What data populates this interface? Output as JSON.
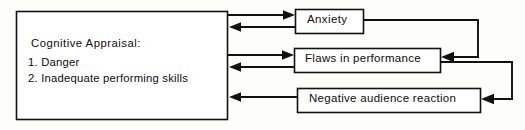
{
  "diagram": {
    "type": "flowchart-feedback-loop",
    "background_color": "#fdfdfb",
    "line_color": "#111111",
    "box_fill": "#ffffff",
    "nodes": [
      {
        "id": "cognitive-appraisal",
        "title": "Cognitive  Appraisal:",
        "items": [
          "1. Danger",
          "2. Inadequate performing skills"
        ]
      },
      {
        "id": "anxiety",
        "label": "Anxiety"
      },
      {
        "id": "flaws-in-performance",
        "label": "Flaws in performance"
      },
      {
        "id": "negative-audience-reaction",
        "label": "Negative audience reaction"
      }
    ],
    "edges": [
      {
        "from": "cognitive-appraisal",
        "to": "anxiety",
        "direction": "right"
      },
      {
        "from": "anxiety",
        "to": "cognitive-appraisal",
        "direction": "left"
      },
      {
        "from": "cognitive-appraisal",
        "to": "flaws-in-performance",
        "direction": "right"
      },
      {
        "from": "flaws-in-performance",
        "to": "cognitive-appraisal",
        "direction": "left"
      },
      {
        "from": "negative-audience-reaction",
        "to": "cognitive-appraisal",
        "direction": "left"
      },
      {
        "from": "anxiety",
        "to": "flaws-in-performance",
        "direction": "loop-right-down-left"
      },
      {
        "from": "flaws-in-performance",
        "to": "negative-audience-reaction",
        "direction": "loop-right-down-left"
      }
    ]
  }
}
